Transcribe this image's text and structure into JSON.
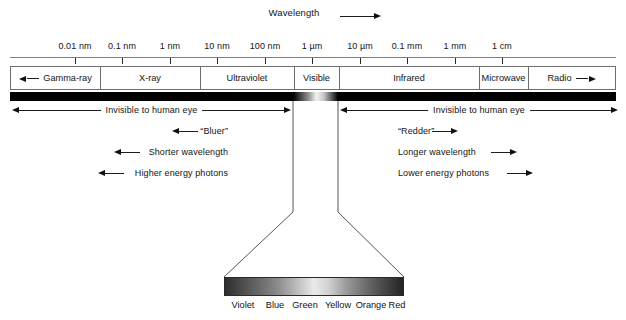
{
  "diagram": {
    "title_label": "Wavelength",
    "title_arrow": "arrow-right-icon"
  },
  "scale": {
    "axis_name": "wavelength-axis",
    "ticks": [
      {
        "label": "0.01 nm",
        "x": 75
      },
      {
        "label": "0.1 nm",
        "x": 122
      },
      {
        "label": "1 nm",
        "x": 170
      },
      {
        "label": "10 nm",
        "x": 217
      },
      {
        "label": "100 nm",
        "x": 265
      },
      {
        "label": "1 µm",
        "x": 312
      },
      {
        "label": "10 µm",
        "x": 360
      },
      {
        "label": "0.1 mm",
        "x": 407
      },
      {
        "label": "1 mm",
        "x": 455
      },
      {
        "label": "1 cm",
        "x": 502
      }
    ]
  },
  "bands": [
    {
      "label": "Gamma-ray",
      "start": 0,
      "end": 89,
      "arrow": "left"
    },
    {
      "label": "X-ray",
      "start": 89,
      "end": 189,
      "arrow": "none"
    },
    {
      "label": "Ultraviolet",
      "start": 189,
      "end": 283,
      "arrow": "none"
    },
    {
      "label": "Visible",
      "start": 283,
      "end": 328,
      "arrow": "none"
    },
    {
      "label": "Infrared",
      "start": 328,
      "end": 468,
      "arrow": "none"
    },
    {
      "label": "Microwave",
      "start": 468,
      "end": 517,
      "arrow": "none"
    },
    {
      "label": "Radio",
      "start": 517,
      "end": 604,
      "arrow": "right"
    }
  ],
  "energy_bar": {
    "name": "electromagnetic-energy-bar",
    "color": "#000000",
    "visible_window_start": 283,
    "visible_window_end": 328
  },
  "invisible_ranges": [
    {
      "label": "Invisible to human eye",
      "from": 12,
      "to": 291,
      "direction": "both"
    },
    {
      "label": "Invisible to human eye",
      "from": 340,
      "to": 618,
      "direction": "both"
    }
  ],
  "annotations_left": [
    {
      "label": "“Bluer”",
      "arrow": "left",
      "text_x": 228,
      "arrow_from": 198,
      "arrow_to": 172,
      "y": 131
    },
    {
      "label": "Shorter wavelength",
      "arrow": "left",
      "text_x": 228,
      "arrow_from": 140,
      "arrow_to": 114,
      "y": 152
    },
    {
      "label": "Higher energy photons",
      "arrow": "left",
      "text_x": 228,
      "arrow_from": 124,
      "arrow_to": 98,
      "y": 173
    }
  ],
  "annotations_right": [
    {
      "label": "“Redder”",
      "arrow": "right",
      "text_x": 398,
      "arrow_from": 432,
      "arrow_to": 458,
      "y": 131
    },
    {
      "label": "Longer wavelength",
      "arrow": "right",
      "text_x": 398,
      "arrow_from": 491,
      "arrow_to": 517,
      "y": 152
    },
    {
      "label": "Lower energy photons",
      "arrow": "right",
      "text_x": 398,
      "arrow_from": 507,
      "arrow_to": 533,
      "y": 173
    }
  ],
  "visible_spectrum": {
    "strip_name": "visible-spectrum-strip",
    "strip_start": 224,
    "strip_end": 404,
    "colors": [
      {
        "name": "Violet",
        "x": 243
      },
      {
        "name": "Blue",
        "x": 275
      },
      {
        "name": "Green",
        "x": 305
      },
      {
        "name": "Yellow",
        "x": 338
      },
      {
        "name": "Orange",
        "x": 371
      },
      {
        "name": "Red",
        "x": 397
      }
    ]
  },
  "funnel": {
    "name": "visible-band-callout-funnel",
    "top_left_x": 293,
    "top_right_x": 338,
    "waist_y": 212,
    "bottom_left_x": 224,
    "bottom_right_x": 404,
    "bottom_y": 277,
    "top_y": 101
  }
}
